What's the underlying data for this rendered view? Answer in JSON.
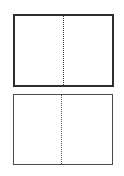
{
  "diagram": {
    "panels": [
      {
        "id": "top",
        "border_color": "#2e2e2e",
        "divider": "dotted-vertical-center",
        "sections": [
          "left",
          "right"
        ]
      },
      {
        "id": "bottom",
        "border_color": "#4a4a4a",
        "divider": "dotted-vertical-center",
        "sections": [
          "left",
          "right"
        ]
      }
    ],
    "background": "#ffffff"
  }
}
